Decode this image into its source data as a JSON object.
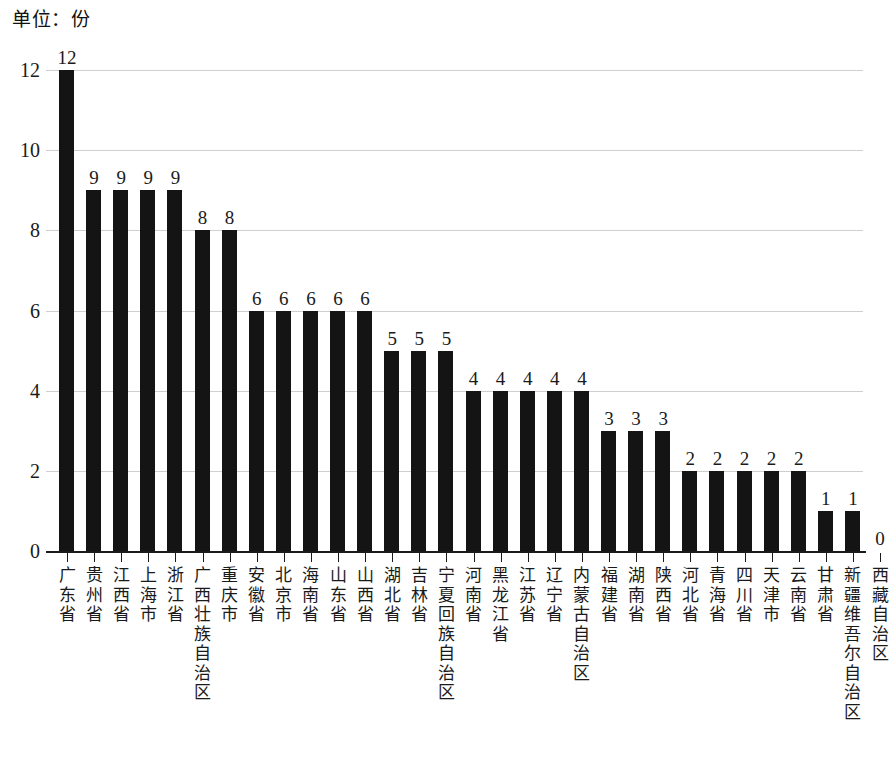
{
  "unit_title": "单位：份",
  "bottom_caption": "",
  "axis": {
    "y_ticks": [
      "0",
      "2",
      "4",
      "6",
      "8",
      "10",
      "12"
    ],
    "x_tick_count": 31
  },
  "colors": {
    "bar": "#141414",
    "gridline": "#cfcfcf",
    "axis": "#1a1a1a",
    "text": "#1a1a1a",
    "background": "#ffffff"
  },
  "chart_data": {
    "type": "bar",
    "title": "单位：份",
    "xlabel": "",
    "ylabel": "",
    "ylim": [
      0,
      12
    ],
    "yticks": [
      0,
      2,
      4,
      6,
      8,
      10,
      12
    ],
    "grid": true,
    "legend": "none",
    "orientation": "vertical",
    "data_labels": true,
    "categories": [
      "广东省",
      "贵州省",
      "江西省",
      "上海市",
      "浙江省",
      "广西壮族自治区",
      "重庆市",
      "安徽省",
      "北京市",
      "海南省",
      "山东省",
      "山西省",
      "湖北省",
      "吉林省",
      "宁夏回族自治区",
      "河南省",
      "黑龙江省",
      "江苏省",
      "辽宁省",
      "内蒙古自治区",
      "福建省",
      "湖南省",
      "陕西省",
      "河北省",
      "青海省",
      "四川省",
      "天津市",
      "云南省",
      "甘肃省",
      "新疆维吾尔自治区",
      "西藏自治区"
    ],
    "values": [
      12,
      9,
      9,
      9,
      9,
      8,
      8,
      6,
      6,
      6,
      6,
      6,
      5,
      5,
      5,
      4,
      4,
      4,
      4,
      4,
      3,
      3,
      3,
      2,
      2,
      2,
      2,
      2,
      1,
      1,
      0
    ]
  }
}
